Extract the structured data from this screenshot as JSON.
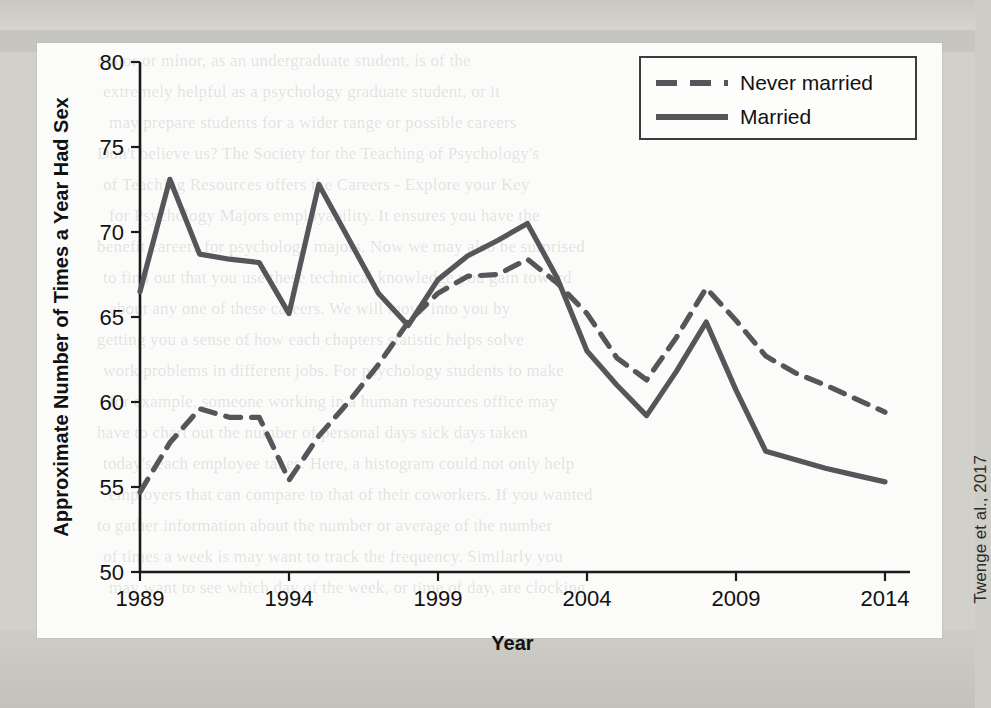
{
  "figure": {
    "citation": "Twenge et al., 2017",
    "xlabel": "Year",
    "ylabel": "Approximate Number of Times a Year Had Sex"
  },
  "legend": {
    "items": [
      {
        "label": "Never married",
        "style": "dashed"
      },
      {
        "label": "Married",
        "style": "solid"
      }
    ]
  },
  "bleed_text": {
    "lines": [
      "major or minor, as an undergraduate student, is of the",
      "extremely helpful as a psychology graduate student, or it",
      "may prepare students for a wider range or possible careers",
      "Don't believe us? The Society for the Teaching of Psychology's",
      "of Teaching Resources offers the Careers - Explore your Key",
      "for Psychology Majors employability. It ensures you have the",
      "benefit careers for psychology majors. Now we may also be surprised",
      "to find out that you use these technical knowledge you gain toward",
      "about any one of these careers. We will move into you by",
      "getting you a sense of how each chapters statistic helps solve",
      "work problems in different jobs. For psychology students to make",
      "for example, someone working in a human resources office may",
      "have to chart out the number of personal days sick days taken",
      "today's each employee takes. Here, a histogram could not only help",
      "employers that can compare to that of their coworkers. If you wanted",
      "to gather information about the number or average of the number",
      "of times a week is may want to track the frequency. Similarly you",
      "may want to see which day of the week, or time of day, are clocking"
    ],
    "bottom_line": "can be used to describe patterns in the data for individual"
  },
  "chart_data": {
    "type": "line",
    "title": "",
    "xlabel": "Year",
    "ylabel": "Approximate Number of Times a Year Had Sex",
    "xlim": [
      1989,
      2014
    ],
    "ylim": [
      50,
      80
    ],
    "xticks": [
      1989,
      1994,
      1999,
      2004,
      2009,
      2014
    ],
    "yticks": [
      50,
      55,
      60,
      65,
      70,
      75,
      80
    ],
    "grid": false,
    "legend_position": "top-right",
    "x": [
      1989,
      1990,
      1991,
      1992,
      1993,
      1994,
      1995,
      1996,
      1997,
      1998,
      1999,
      2000,
      2001,
      2002,
      2003,
      2004,
      2005,
      2006,
      2007,
      2008,
      2009,
      2010,
      2011,
      2012,
      2013,
      2014
    ],
    "series": [
      {
        "name": "Married",
        "style": "solid",
        "values": [
          66.5,
          73.1,
          68.7,
          68.4,
          68.2,
          65.2,
          72.8,
          69.6,
          66.4,
          64.5,
          67.2,
          68.6,
          69.5,
          70.5,
          67.3,
          63.0,
          61.0,
          59.2,
          61.8,
          64.7,
          60.7,
          57.1,
          56.6,
          56.1,
          55.7,
          55.3
        ]
      },
      {
        "name": "Never married",
        "style": "dashed",
        "values": [
          54.7,
          57.6,
          59.6,
          59.1,
          59.1,
          55.4,
          58.0,
          60.0,
          62.2,
          64.7,
          66.4,
          67.4,
          67.5,
          68.4,
          67.0,
          65.2,
          62.6,
          61.3,
          63.8,
          66.7,
          64.8,
          62.7,
          61.7,
          61.0,
          60.2,
          59.4
        ]
      }
    ]
  }
}
